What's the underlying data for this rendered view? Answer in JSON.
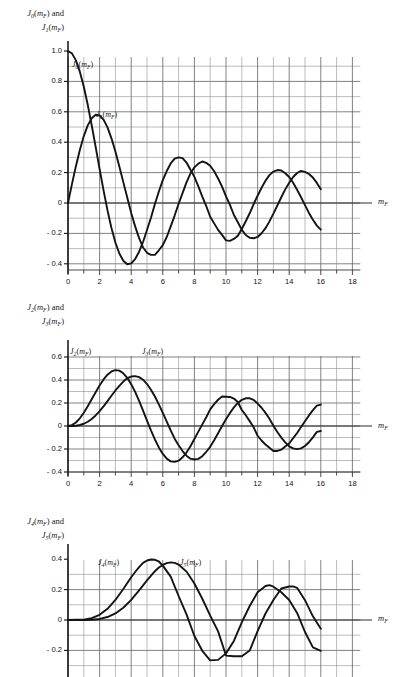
{
  "figure": {
    "background_color": "#ffffff",
    "grid_color": "#8f8f8f",
    "grid_major_color": "#6a6a6a",
    "curve_color": "#141414",
    "axis_color": "#333333"
  },
  "chart_data": [
    {
      "type": "line",
      "title": "",
      "ylabel": "J0(mF) and J1(mF)",
      "ylabel_line1": "J",
      "ylabel_line1_sub": "0",
      "ylabel_line1_rest": "(m",
      "ylabel_line1_sub2": "F",
      "ylabel_line1_tail": ") and",
      "ylabel_line2_sub": "1",
      "xlabel": "mF",
      "xlabel_base": "m",
      "xlabel_sub": "F",
      "xlim": [
        0,
        18.5
      ],
      "ylim": [
        -0.5,
        1.05
      ],
      "xticks": [
        0,
        2,
        4,
        6,
        8,
        10,
        12,
        14,
        16,
        18
      ],
      "xticklabels": [
        "0",
        "2",
        "4",
        "6",
        "8",
        "10",
        "12",
        "14",
        "16",
        "18"
      ],
      "yticks": [
        1.0,
        0.8,
        0.6,
        0.4,
        0.2,
        0,
        -0.2,
        -0.4
      ],
      "yticklabels": [
        "1.0",
        "0.8",
        "0.6",
        "0.4",
        "0.2",
        "0",
        "- 0.2",
        "- 0.4"
      ],
      "grid": true,
      "grid_x_step": 1,
      "grid_y_step": 0.1,
      "series": [
        {
          "name": "J0(mF)",
          "label_base": "J",
          "label_sub": "0",
          "label_tail": "(m",
          "label_sub2": "F",
          "label_end": ")",
          "label_x": 2.1,
          "label_y": 0.93,
          "x": [
            0,
            0.25,
            0.5,
            0.75,
            1,
            1.25,
            1.5,
            1.75,
            2,
            2.25,
            2.5,
            2.75,
            3,
            3.25,
            3.5,
            3.75,
            4,
            4.25,
            4.5,
            4.75,
            5,
            5.25,
            5.5,
            5.75,
            6,
            6.25,
            6.5,
            6.75,
            7,
            7.25,
            7.5,
            7.75,
            8,
            8.25,
            8.5,
            8.75,
            9,
            9.25,
            9.5,
            9.75,
            10,
            10.25,
            10.5,
            10.75,
            11,
            11.25,
            11.5,
            11.75,
            12,
            12.25,
            12.5,
            12.75,
            13,
            13.25,
            13.5,
            13.75,
            14,
            14.25,
            14.5,
            14.75,
            15,
            15.25,
            15.5,
            15.75,
            16
          ],
          "y": [
            1.0,
            0.9844,
            0.9385,
            0.8642,
            0.7652,
            0.6459,
            0.5118,
            0.369,
            0.2239,
            0.0827,
            -0.0484,
            -0.1641,
            -0.2601,
            -0.3325,
            -0.3801,
            -0.4026,
            -0.3971,
            -0.3687,
            -0.3205,
            -0.2566,
            -0.1776,
            -0.0968,
            -0.0068,
            0.0758,
            0.1506,
            0.2101,
            0.2601,
            0.2921,
            0.3001,
            0.2951,
            0.2663,
            0.2183,
            0.1717,
            0.1097,
            0.0419,
            -0.0198,
            -0.0903,
            -0.134,
            -0.1768,
            -0.2097,
            -0.2459,
            -0.249,
            -0.2366,
            -0.2156,
            -0.1712,
            -0.12,
            -0.0677,
            -0.0068,
            0.0477,
            0.1005,
            0.1469,
            0.1831,
            0.2069,
            0.2167,
            0.214,
            0.196,
            0.1711,
            0.1334,
            0.0875,
            0.0377,
            -0.0142,
            -0.0652,
            -0.1107,
            -0.149,
            -0.1749
          ]
        },
        {
          "name": "J1(mF)",
          "label_base": "J",
          "label_sub": "1",
          "label_tail": "(m",
          "label_sub2": "F",
          "label_end": ")",
          "label_x": 3.6,
          "label_y": 0.6,
          "x": [
            0,
            0.25,
            0.5,
            0.75,
            1,
            1.25,
            1.5,
            1.75,
            2,
            2.25,
            2.5,
            2.75,
            3,
            3.25,
            3.5,
            3.75,
            4,
            4.25,
            4.5,
            4.75,
            5,
            5.25,
            5.5,
            5.75,
            6,
            6.25,
            6.5,
            6.75,
            7,
            7.25,
            7.5,
            7.75,
            8,
            8.25,
            8.5,
            8.75,
            9,
            9.25,
            9.5,
            9.75,
            10,
            10.25,
            10.5,
            10.75,
            11,
            11.25,
            11.5,
            11.75,
            12,
            12.25,
            12.5,
            12.75,
            13,
            13.25,
            13.5,
            13.75,
            14,
            14.25,
            14.5,
            14.75,
            15,
            15.25,
            15.5,
            15.75,
            16
          ],
          "y": [
            0.0,
            0.124,
            0.2423,
            0.3492,
            0.4401,
            0.5106,
            0.5579,
            0.5802,
            0.5767,
            0.5484,
            0.4971,
            0.4256,
            0.3391,
            0.2403,
            0.1374,
            0.0366,
            -0.066,
            -0.1538,
            -0.2311,
            -0.2926,
            -0.3276,
            -0.3414,
            -0.3414,
            -0.311,
            -0.2767,
            -0.2238,
            -0.1538,
            -0.0826,
            -0.0047,
            0.0646,
            0.1352,
            0.1934,
            0.2346,
            0.2594,
            0.2731,
            0.2639,
            0.2453,
            0.2093,
            0.1613,
            0.1072,
            0.0435,
            -0.0126,
            -0.0789,
            -0.1266,
            -0.1768,
            -0.2103,
            -0.2284,
            -0.232,
            -0.2234,
            -0.199,
            -0.1655,
            -0.1208,
            -0.0703,
            -0.0166,
            0.038,
            0.0896,
            0.1334,
            0.1708,
            0.1972,
            0.2112,
            0.2051,
            0.1907,
            0.1673,
            0.1322,
            0.0904
          ]
        }
      ]
    },
    {
      "type": "line",
      "title": "",
      "ylabel": "J2(mF) and J3(mF)",
      "ylabel_line1_sub": "2",
      "ylabel_line2_sub": "3",
      "xlabel": "mF",
      "xlabel_base": "m",
      "xlabel_sub": "F",
      "xlim": [
        0,
        18.5
      ],
      "ylim": [
        -0.45,
        0.65
      ],
      "xticks": [
        0,
        2,
        4,
        6,
        8,
        10,
        12,
        14,
        16,
        18
      ],
      "xticklabels": [
        "0",
        "2",
        "4",
        "6",
        "8",
        "10",
        "12",
        "14",
        "16",
        "18"
      ],
      "yticks": [
        0.6,
        0.4,
        0.2,
        0,
        -0.2,
        -0.4
      ],
      "yticklabels": [
        "0.6",
        "0.4",
        "0.2",
        "0",
        "- 0.2",
        "- 0.4"
      ],
      "grid": true,
      "grid_x_step": 1,
      "grid_y_step": 0.1,
      "series": [
        {
          "name": "J2(mF)",
          "label_base": "J",
          "label_sub": "2",
          "label_tail": "(m",
          "label_sub2": "F",
          "label_end": ")",
          "label_x": 0.6,
          "label_y": 0.455,
          "x": [
            0,
            0.25,
            0.5,
            0.75,
            1,
            1.25,
            1.5,
            1.75,
            2,
            2.25,
            2.5,
            2.75,
            3,
            3.25,
            3.5,
            3.75,
            4,
            4.25,
            4.5,
            4.75,
            5,
            5.25,
            5.5,
            5.75,
            6,
            6.25,
            6.5,
            6.75,
            7,
            7.25,
            7.5,
            7.75,
            8,
            8.25,
            8.5,
            8.75,
            9,
            9.25,
            9.5,
            9.75,
            10,
            10.25,
            10.5,
            10.75,
            11,
            11.25,
            11.5,
            11.75,
            12,
            12.25,
            12.5,
            12.75,
            13,
            13.25,
            13.5,
            13.75,
            14,
            14.25,
            14.5,
            14.75,
            15,
            15.25,
            15.5,
            15.75,
            16
          ],
          "y": [
            0.0,
            0.0078,
            0.0306,
            0.067,
            0.1149,
            0.1711,
            0.2321,
            0.294,
            0.3528,
            0.4048,
            0.4461,
            0.4743,
            0.4861,
            0.4813,
            0.4586,
            0.4194,
            0.3641,
            0.2966,
            0.2178,
            0.1332,
            0.0466,
            -0.038,
            -0.1173,
            -0.1862,
            -0.2429,
            -0.2838,
            -0.3074,
            -0.3123,
            -0.3014,
            -0.2723,
            -0.2303,
            -0.1767,
            -0.113,
            -0.0486,
            0.0145,
            0.0765,
            0.1448,
            0.1907,
            0.2282,
            0.2559,
            0.2546,
            0.2528,
            0.2388,
            0.2086,
            0.139,
            0.0942,
            0.0424,
            -0.0116,
            -0.0849,
            -0.1261,
            -0.1613,
            -0.1892,
            -0.2177,
            -0.2168,
            -0.2058,
            -0.179,
            -0.152,
            -0.1059,
            -0.0607,
            -0.0081,
            0.0416,
            0.0921,
            0.1381,
            0.1764,
            0.1863
          ]
        },
        {
          "name": "J3(mF)",
          "label_base": "J",
          "label_sub": "3",
          "label_tail": "(m",
          "label_sub2": "F",
          "label_end": ")",
          "label_x": 4.1,
          "label_y": 0.455,
          "x": [
            0,
            0.25,
            0.5,
            0.75,
            1,
            1.25,
            1.5,
            1.75,
            2,
            2.25,
            2.5,
            2.75,
            3,
            3.25,
            3.5,
            3.75,
            4,
            4.25,
            4.5,
            4.75,
            5,
            5.25,
            5.5,
            5.75,
            6,
            6.25,
            6.5,
            6.75,
            7,
            7.25,
            7.5,
            7.75,
            8,
            8.25,
            8.5,
            8.75,
            9,
            9.25,
            9.5,
            9.75,
            10,
            10.25,
            10.5,
            10.75,
            11,
            11.25,
            11.5,
            11.75,
            12,
            12.25,
            12.5,
            12.75,
            13,
            13.25,
            13.5,
            13.75,
            14,
            14.25,
            14.5,
            14.75,
            15,
            15.25,
            15.5,
            15.75,
            16
          ],
          "y": [
            0.0,
            0.0003,
            0.0026,
            0.0086,
            0.0196,
            0.0369,
            0.061,
            0.0919,
            0.1289,
            0.1707,
            0.2166,
            0.2626,
            0.3091,
            0.3492,
            0.3868,
            0.4155,
            0.4302,
            0.4341,
            0.4247,
            0.4024,
            0.3648,
            0.3154,
            0.2561,
            0.1886,
            0.1148,
            0.0388,
            -0.038,
            -0.11,
            -0.1676,
            -0.2179,
            -0.2581,
            -0.2839,
            -0.2911,
            -0.2861,
            -0.2626,
            -0.2242,
            -0.1809,
            -0.1243,
            -0.063,
            -0.0005,
            0.0583,
            0.113,
            0.162,
            0.2007,
            0.2273,
            0.2411,
            0.241,
            0.2268,
            0.1951,
            0.1589,
            0.1143,
            0.0632,
            0.003,
            -0.0522,
            -0.1013,
            -0.1422,
            -0.1768,
            -0.1945,
            -0.2016,
            -0.195,
            -0.174,
            -0.141,
            -0.0987,
            -0.0511,
            -0.0438
          ]
        }
      ]
    },
    {
      "type": "line",
      "title": "",
      "ylabel": "J4(mF) and J5(mF)",
      "ylabel_line1_sub": "4",
      "ylabel_line2_sub": "5",
      "xlabel": "mF",
      "xlabel_base": "m",
      "xlabel_sub": "F",
      "xlim": [
        0,
        18.5
      ],
      "ylim": [
        -0.32,
        0.48
      ],
      "xticks": [],
      "xticklabels": [],
      "yticks": [
        0.4,
        0.2,
        0,
        -0.2
      ],
      "yticklabels": [
        "0.4",
        "0.2",
        "0",
        "- 0.2"
      ],
      "grid": true,
      "grid_x_step": 1,
      "grid_y_step": 0.1,
      "clipped_bottom": true,
      "series": [
        {
          "name": "J4(mF)",
          "label_base": "J",
          "label_sub": "4",
          "label_tail": "(m",
          "label_sub2": "F",
          "label_end": ")",
          "label_x": 2.4,
          "label_y": 0.355,
          "x": [
            0,
            0.5,
            1,
            1.5,
            2,
            2.5,
            3,
            3.5,
            4,
            4.25,
            4.5,
            4.75,
            5,
            5.25,
            5.5,
            5.75,
            6,
            6.5,
            7,
            7.5,
            8,
            8.5,
            9,
            9.5,
            10,
            10.5,
            11,
            11.5,
            12,
            12.5,
            12.75,
            13,
            13.5,
            14,
            14.5,
            15,
            15.5,
            16
          ],
          "y": [
            0.0,
            0.0016,
            0.0025,
            0.0118,
            0.034,
            0.0738,
            0.132,
            0.2044,
            0.2811,
            0.3159,
            0.3484,
            0.376,
            0.3912,
            0.3979,
            0.396,
            0.385,
            0.3576,
            0.2855,
            0.1578,
            0.0374,
            -0.1054,
            -0.2027,
            -0.2655,
            -0.2623,
            -0.2196,
            -0.1375,
            -0.015,
            0.0919,
            0.1825,
            0.2235,
            0.2294,
            0.2193,
            0.1825,
            0.1316,
            0.0462,
            -0.079,
            -0.1798,
            -0.2026
          ]
        },
        {
          "name": "J5(mF)",
          "label_base": "J",
          "label_sub": "5",
          "label_tail": "(m",
          "label_sub2": "F",
          "label_end": ")",
          "label_x": 7.6,
          "label_y": 0.355,
          "x": [
            0,
            0.5,
            1,
            1.5,
            2,
            2.5,
            3,
            3.5,
            4,
            4.5,
            5,
            5.5,
            5.75,
            6,
            6.25,
            6.5,
            6.75,
            7,
            7.5,
            8,
            8.5,
            9,
            9.5,
            10,
            10.5,
            11,
            11.5,
            12,
            12.5,
            13,
            13.5,
            14,
            14.25,
            14.5,
            15,
            15.5,
            16
          ],
          "y": [
            0.0,
            0.0002,
            0.0002,
            0.0018,
            0.007,
            0.0195,
            0.043,
            0.0804,
            0.1321,
            0.1947,
            0.2611,
            0.3209,
            0.345,
            0.3621,
            0.3745,
            0.3792,
            0.376,
            0.3648,
            0.3185,
            0.2404,
            0.1399,
            0.0292,
            -0.0748,
            -0.2341,
            -0.2383,
            -0.2383,
            -0.2009,
            -0.0735,
            0.0428,
            0.1316,
            0.2075,
            0.2204,
            0.2213,
            0.212,
            0.1305,
            0.024,
            -0.0575
          ]
        }
      ]
    }
  ]
}
